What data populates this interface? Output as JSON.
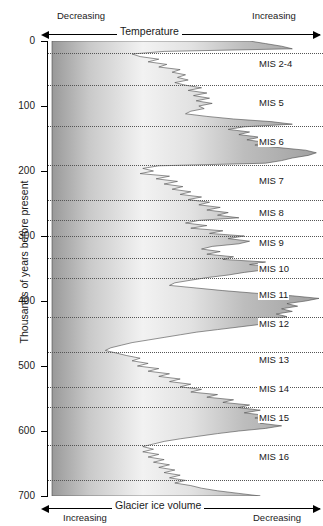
{
  "chart_data": {
    "type": "area",
    "title": "",
    "orientation": "vertical-depth",
    "xlabel": "Glacier ice volume",
    "ylabel": "Thousands of years before present",
    "ylim": [
      0,
      700
    ],
    "yticks": [
      0,
      100,
      200,
      300,
      400,
      500,
      600,
      700
    ],
    "ytick_labels": [
      "0",
      "100",
      "200",
      "300",
      "400",
      "500",
      "600",
      "700"
    ],
    "grid": true,
    "top_axis": {
      "title": "Temperature",
      "left_label": "Decreasing",
      "right_label": "Increasing"
    },
    "bottom_axis": {
      "title": "Glacier ice volume",
      "left_label": "Increasing",
      "right_label": "Decreasing"
    },
    "annotations": [
      {
        "label": "MIS 2-4",
        "y": 35
      },
      {
        "label": "MIS 5",
        "y": 95
      },
      {
        "label": "MIS 6",
        "y": 155
      },
      {
        "label": "MIS 7",
        "y": 215
      },
      {
        "label": "MIS 8",
        "y": 265
      },
      {
        "label": "MIS 9",
        "y": 310
      },
      {
        "label": "MIS 10",
        "y": 350
      },
      {
        "label": "MIS 11",
        "y": 390
      },
      {
        "label": "MIS 12",
        "y": 435
      },
      {
        "label": "MIS 13",
        "y": 490
      },
      {
        "label": "MIS 14",
        "y": 535
      },
      {
        "label": "MIS 15",
        "y": 580
      },
      {
        "label": "MIS 16",
        "y": 640
      }
    ],
    "stage_boundaries": [
      18,
      68,
      130,
      190,
      245,
      275,
      300,
      334,
      364,
      424,
      478,
      533,
      563,
      621,
      676
    ],
    "series": [
      {
        "name": "Proxy curve (relative temperature / ice volume)",
        "x_units": "relative (0 = max ice, 1 = max warmth)",
        "points": [
          [
            0,
            0.74
          ],
          [
            4,
            0.8
          ],
          [
            8,
            0.86
          ],
          [
            12,
            0.9
          ],
          [
            16,
            0.42
          ],
          [
            20,
            0.3
          ],
          [
            24,
            0.33
          ],
          [
            28,
            0.4
          ],
          [
            32,
            0.36
          ],
          [
            36,
            0.43
          ],
          [
            40,
            0.4
          ],
          [
            44,
            0.48
          ],
          [
            48,
            0.45
          ],
          [
            52,
            0.5
          ],
          [
            56,
            0.47
          ],
          [
            60,
            0.51
          ],
          [
            64,
            0.46
          ],
          [
            68,
            0.5
          ],
          [
            72,
            0.56
          ],
          [
            76,
            0.51
          ],
          [
            80,
            0.58
          ],
          [
            84,
            0.53
          ],
          [
            88,
            0.59
          ],
          [
            92,
            0.54
          ],
          [
            96,
            0.6
          ],
          [
            100,
            0.55
          ],
          [
            104,
            0.57
          ],
          [
            108,
            0.52
          ],
          [
            112,
            0.5
          ],
          [
            116,
            0.58
          ],
          [
            120,
            0.68
          ],
          [
            124,
            0.82
          ],
          [
            128,
            0.9
          ],
          [
            132,
            0.72
          ],
          [
            136,
            0.66
          ],
          [
            140,
            0.74
          ],
          [
            144,
            0.7
          ],
          [
            148,
            0.78
          ],
          [
            152,
            0.73
          ],
          [
            156,
            0.8
          ],
          [
            160,
            0.76
          ],
          [
            164,
            0.85
          ],
          [
            168,
            0.95
          ],
          [
            172,
            0.99
          ],
          [
            176,
            0.96
          ],
          [
            180,
            0.9
          ],
          [
            184,
            0.86
          ],
          [
            188,
            0.8
          ],
          [
            192,
            0.4
          ],
          [
            196,
            0.34
          ],
          [
            200,
            0.38
          ],
          [
            204,
            0.33
          ],
          [
            208,
            0.44
          ],
          [
            212,
            0.39
          ],
          [
            216,
            0.47
          ],
          [
            220,
            0.42
          ],
          [
            224,
            0.49
          ],
          [
            228,
            0.45
          ],
          [
            232,
            0.52
          ],
          [
            236,
            0.48
          ],
          [
            240,
            0.56
          ],
          [
            244,
            0.51
          ],
          [
            248,
            0.59
          ],
          [
            252,
            0.55
          ],
          [
            256,
            0.63
          ],
          [
            260,
            0.58
          ],
          [
            264,
            0.66
          ],
          [
            268,
            0.62
          ],
          [
            272,
            0.7
          ],
          [
            276,
            0.55
          ],
          [
            280,
            0.5
          ],
          [
            284,
            0.58
          ],
          [
            288,
            0.52
          ],
          [
            292,
            0.64
          ],
          [
            296,
            0.59
          ],
          [
            300,
            0.72
          ],
          [
            304,
            0.66
          ],
          [
            308,
            0.74
          ],
          [
            312,
            0.7
          ],
          [
            316,
            0.6
          ],
          [
            320,
            0.56
          ],
          [
            324,
            0.63
          ],
          [
            328,
            0.58
          ],
          [
            332,
            0.68
          ],
          [
            336,
            0.64
          ],
          [
            340,
            0.8
          ],
          [
            344,
            0.74
          ],
          [
            348,
            0.86
          ],
          [
            352,
            0.8
          ],
          [
            356,
            0.72
          ],
          [
            360,
            0.66
          ],
          [
            364,
            0.58
          ],
          [
            368,
            0.52
          ],
          [
            372,
            0.46
          ],
          [
            376,
            0.44
          ],
          [
            380,
            0.54
          ],
          [
            384,
            0.64
          ],
          [
            388,
            0.76
          ],
          [
            392,
            0.9
          ],
          [
            396,
            1.0
          ],
          [
            400,
            0.95
          ],
          [
            404,
            0.88
          ],
          [
            408,
            0.92
          ],
          [
            412,
            0.86
          ],
          [
            416,
            0.9
          ],
          [
            420,
            0.84
          ],
          [
            424,
            0.88
          ],
          [
            428,
            0.82
          ],
          [
            432,
            0.86
          ],
          [
            436,
            0.78
          ],
          [
            440,
            0.7
          ],
          [
            444,
            0.62
          ],
          [
            448,
            0.54
          ],
          [
            452,
            0.48
          ],
          [
            456,
            0.42
          ],
          [
            460,
            0.36
          ],
          [
            464,
            0.3
          ],
          [
            468,
            0.26
          ],
          [
            472,
            0.22
          ],
          [
            476,
            0.2
          ],
          [
            480,
            0.24
          ],
          [
            484,
            0.28
          ],
          [
            488,
            0.33
          ],
          [
            492,
            0.3
          ],
          [
            496,
            0.36
          ],
          [
            500,
            0.32
          ],
          [
            504,
            0.4
          ],
          [
            508,
            0.36
          ],
          [
            512,
            0.44
          ],
          [
            516,
            0.4
          ],
          [
            520,
            0.48
          ],
          [
            524,
            0.44
          ],
          [
            528,
            0.52
          ],
          [
            532,
            0.48
          ],
          [
            536,
            0.56
          ],
          [
            540,
            0.52
          ],
          [
            544,
            0.62
          ],
          [
            548,
            0.58
          ],
          [
            552,
            0.68
          ],
          [
            556,
            0.64
          ],
          [
            560,
            0.74
          ],
          [
            564,
            0.7
          ],
          [
            568,
            0.78
          ],
          [
            572,
            0.72
          ],
          [
            576,
            0.8
          ],
          [
            580,
            0.76
          ],
          [
            584,
            0.84
          ],
          [
            588,
            0.78
          ],
          [
            592,
            0.86
          ],
          [
            596,
            0.8
          ],
          [
            600,
            0.7
          ],
          [
            604,
            0.62
          ],
          [
            608,
            0.55
          ],
          [
            612,
            0.48
          ],
          [
            616,
            0.42
          ],
          [
            620,
            0.38
          ],
          [
            624,
            0.34
          ],
          [
            628,
            0.38
          ],
          [
            632,
            0.34
          ],
          [
            636,
            0.4
          ],
          [
            640,
            0.36
          ],
          [
            644,
            0.42
          ],
          [
            648,
            0.38
          ],
          [
            652,
            0.44
          ],
          [
            656,
            0.4
          ],
          [
            660,
            0.46
          ],
          [
            664,
            0.42
          ],
          [
            668,
            0.48
          ],
          [
            672,
            0.44
          ],
          [
            676,
            0.5
          ],
          [
            680,
            0.46
          ],
          [
            684,
            0.52
          ],
          [
            688,
            0.56
          ],
          [
            692,
            0.62
          ],
          [
            696,
            0.7
          ],
          [
            700,
            0.78
          ]
        ]
      }
    ],
    "fill": {
      "gradient": [
        "#9a9a9a",
        "#f4f4f4",
        "#a8a8a8"
      ],
      "description": "horizontal gray gradient, dark at edges, light in the middle"
    }
  }
}
